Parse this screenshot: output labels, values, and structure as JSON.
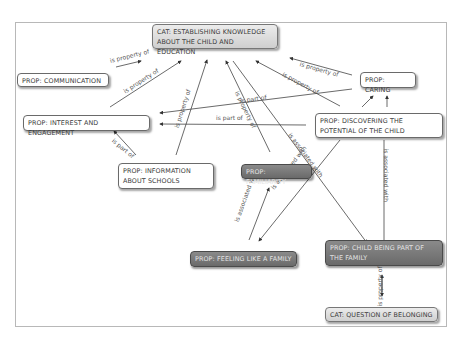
{
  "diagram": {
    "type": "concept-map",
    "nodes": [
      {
        "id": "cat_establishing",
        "label": "CAT: ESTABLISHING KNOWLEDGE ABOUT THE CHILD AND EDUCATION",
        "style": "category"
      },
      {
        "id": "prop_communication",
        "label": "PROP: COMMUNICATION",
        "style": "light"
      },
      {
        "id": "prop_caring",
        "label": "PROP: CARING",
        "style": "light"
      },
      {
        "id": "prop_interest",
        "label": "PROP: INTEREST AND ENGAGEMENT",
        "style": "light"
      },
      {
        "id": "prop_discovering",
        "label": "PROP: DISCOVERING THE POTENTIAL OF THE CHILD",
        "style": "light"
      },
      {
        "id": "prop_information",
        "label": "PROP: INFORMATION ABOUT SCHOOLS",
        "style": "light"
      },
      {
        "id": "prop_familiarity",
        "label": "PROP: FAMILIARITY",
        "style": "dark"
      },
      {
        "id": "prop_feeling",
        "label": "PROP: FEELING LIKE A FAMILY",
        "style": "dark"
      },
      {
        "id": "prop_child_part",
        "label": "PROP: CHILD BEING PART OF THE FAMILY",
        "style": "dark"
      },
      {
        "id": "cat_belonging",
        "label": "CAT: QUESTION OF BELONGING",
        "style": "category"
      }
    ],
    "edge_labels": {
      "property": "is property of",
      "part": "is part of",
      "associated": "is associated with"
    },
    "edges": [
      {
        "from": "prop_communication",
        "to": "cat_establishing",
        "label": "is property of"
      },
      {
        "from": "prop_interest",
        "to": "cat_establishing",
        "label": "is property of"
      },
      {
        "from": "prop_information",
        "to": "cat_establishing",
        "label": "is property of"
      },
      {
        "from": "prop_familiarity",
        "to": "cat_establishing",
        "label": "is property of"
      },
      {
        "from": "prop_caring",
        "to": "cat_establishing",
        "label": "is property of"
      },
      {
        "from": "prop_discovering",
        "to": "cat_establishing",
        "label": "is property of"
      },
      {
        "from": "prop_caring",
        "to": "prop_interest",
        "label": "is part of"
      },
      {
        "from": "prop_discovering",
        "to": "prop_interest",
        "label": "is part of"
      },
      {
        "from": "prop_information",
        "to": "prop_interest",
        "label": "is part of"
      },
      {
        "from": "cat_establishing",
        "to": "prop_child_part",
        "label": "is associated with"
      },
      {
        "from": "prop_discovering",
        "to": "prop_feeling",
        "label": "is associated with"
      },
      {
        "from": "prop_feeling",
        "to": "prop_familiarity",
        "label": "is associated with"
      },
      {
        "from": "prop_caring",
        "to": "prop_child_part",
        "label": "is associated with"
      },
      {
        "from": "prop_discovering",
        "to": "prop_caring",
        "label": ""
      },
      {
        "from": "cat_belonging",
        "to": "prop_child_part",
        "label": "is property of"
      }
    ]
  }
}
